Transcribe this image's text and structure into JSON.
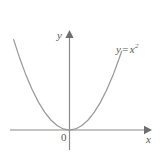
{
  "figure": {
    "type": "math-graph",
    "background_color": "#ffffff",
    "axis_color": "#8a8a8a",
    "curve_color": "#9a9a9a",
    "text_color": "#5a5a5a",
    "origin_label": "0",
    "x_axis_label": "x",
    "y_axis_label": "y",
    "curve_label_base": "y",
    "curve_label_equals": "=",
    "curve_label_variable": "x",
    "curve_label_exponent": "2",
    "curve_label_full": "y = x²"
  },
  "chart_data": {
    "type": "line",
    "title": "",
    "subtitle": "",
    "xlabel": "x",
    "ylabel": "y",
    "legend": [
      "y = x²"
    ],
    "legend_position": "inline-right",
    "grid": false,
    "annotations": [
      "0"
    ],
    "xlim": [
      -2.6,
      3.0
    ],
    "ylim": [
      -0.45,
      5.6
    ],
    "origin_px": {
      "x": 69.5,
      "y": 130
    },
    "series": [
      {
        "name": "y = x²",
        "equation": "y = x^2",
        "color": "#9a9a9a",
        "x": [
          -2.25,
          -2.0,
          -1.75,
          -1.5,
          -1.25,
          -1.0,
          -0.75,
          -0.5,
          -0.25,
          0,
          0.25,
          0.5,
          0.75,
          1.0,
          1.25,
          1.5,
          1.75,
          2.0,
          2.1
        ],
        "values": [
          5.06,
          4.0,
          3.06,
          2.25,
          1.56,
          1.0,
          0.56,
          0.25,
          0.06,
          0,
          0.06,
          0.25,
          0.56,
          1.0,
          1.56,
          2.25,
          3.06,
          4.0,
          4.41
        ]
      }
    ]
  }
}
